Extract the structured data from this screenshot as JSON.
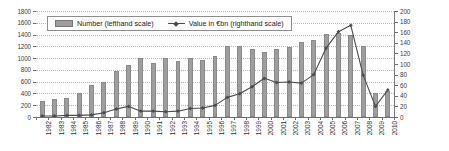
{
  "chart_data": {
    "type": "bar",
    "title": "",
    "subtitle": "",
    "xlabel": "",
    "ylabel": "",
    "grid": true,
    "legend_position": "top-left-inside",
    "categories": [
      "1982",
      "1983",
      "1984",
      "1985",
      "1986",
      "1987",
      "1988",
      "1989",
      "1990",
      "1991",
      "1992",
      "1993",
      "1994",
      "1995",
      "1996",
      "1997",
      "1998",
      "1999",
      "2000",
      "2001",
      "2002",
      "2003",
      "2004",
      "2005",
      "2006",
      "2007",
      "2008",
      "2009",
      "2010"
    ],
    "axes": {
      "left": {
        "label": "Number (lefthand scale)",
        "ylim": [
          0,
          1800
        ],
        "tick_step": 200,
        "ticks": [
          0,
          200,
          400,
          600,
          800,
          1000,
          1200,
          1400,
          1600,
          1800
        ]
      },
      "right": {
        "label": "Value in €bn (righthand scale)",
        "ylim": [
          0,
          200
        ],
        "tick_step": 20,
        "ticks": [
          0,
          20,
          40,
          60,
          80,
          100,
          120,
          140,
          160,
          180,
          200
        ]
      }
    },
    "series": [
      {
        "name": "Number (lefthand scale)",
        "type": "bar",
        "axis": "left",
        "color": "#9e9e9e",
        "values": [
          280,
          310,
          330,
          400,
          545,
          600,
          775,
          885,
          1010,
          910,
          1000,
          945,
          1000,
          965,
          1040,
          1205,
          1200,
          1160,
          1110,
          1155,
          1195,
          1280,
          1315,
          1415,
          1435,
          1400,
          1200,
          400,
          450
        ]
      },
      {
        "name": "Value in €bn (righthand scale)",
        "type": "line",
        "axis": "right",
        "color": "#4a4a4a",
        "marker": "diamond",
        "values": [
          2,
          2,
          3,
          3,
          4,
          8,
          15,
          20,
          11,
          11,
          10,
          11,
          16,
          17,
          22,
          37,
          44,
          57,
          73,
          65,
          66,
          64,
          80,
          130,
          161,
          173,
          79,
          20,
          51
        ]
      }
    ]
  },
  "legend": {
    "items": [
      {
        "label": "Number (lefthand scale)",
        "marker": "bar-swatch"
      },
      {
        "label": "Value in €bn (righthand scale)",
        "marker": "line-marker-swatch"
      }
    ]
  },
  "colors": {
    "bar_fill": "#9e9e9e",
    "bar_stroke": "#8a8a8a",
    "line": "#4a4a4a",
    "gridline": "#b9b9b9",
    "axis": "#6e6e6e",
    "tick_text": "#3b3b3b",
    "background": "#ffffff"
  }
}
